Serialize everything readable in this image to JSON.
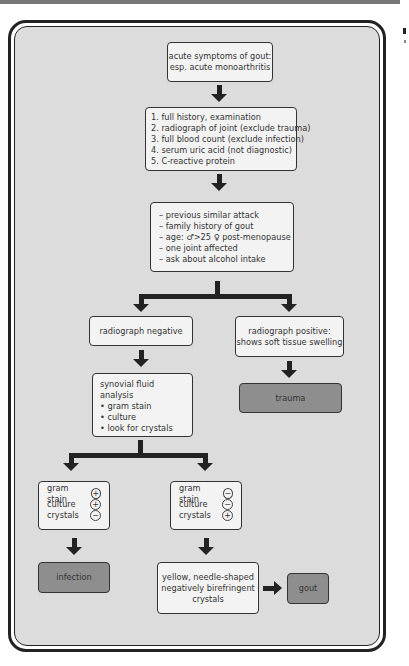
{
  "flowchart": {
    "start": {
      "lines": [
        "acute symptoms of gout:",
        "esp. acute monoarthritis"
      ]
    },
    "investigations": {
      "items": [
        "1. full history, examination",
        "2. radiograph of joint (exclude trauma)",
        "3. full blood count (exclude infection)",
        "4. serum uric acid (not diagnostic)",
        "5. C-reactive protein"
      ]
    },
    "history_points": {
      "items": [
        "– previous similar attack",
        "– family history of gout",
        "– age: ♂>25  ♀ post-menopause",
        "– one joint affected",
        "– ask about alcohol intake"
      ]
    },
    "radiograph_negative": {
      "label": "radiograph negative"
    },
    "radiograph_positive": {
      "lines": [
        "radiograph positive:",
        "shows soft tissue swelling"
      ]
    },
    "trauma": {
      "label": "trauma"
    },
    "synovial": {
      "title": "synovial fluid analysis",
      "items": [
        "• gram stain",
        "• culture",
        "• look for crystals"
      ]
    },
    "infection_results": {
      "rows": [
        {
          "label": "gram stain",
          "sign": "+"
        },
        {
          "label": "culture",
          "sign": "+"
        },
        {
          "label": "crystals",
          "sign": "−"
        }
      ]
    },
    "gout_results": {
      "rows": [
        {
          "label": "gram stain",
          "sign": "−"
        },
        {
          "label": "culture",
          "sign": "−"
        },
        {
          "label": "crystals",
          "sign": "+"
        }
      ]
    },
    "infection": {
      "label": "infection"
    },
    "crystals_desc": {
      "lines": [
        "yellow, needle-shaped",
        "negatively birefringent",
        "crystals"
      ]
    },
    "gout": {
      "label": "gout"
    }
  },
  "colors": {
    "panel_bg": "#dcdcdc",
    "box_bg": "#f3f3f3",
    "outcome_bg": "#8e8e8e",
    "arrow": "#222222"
  }
}
